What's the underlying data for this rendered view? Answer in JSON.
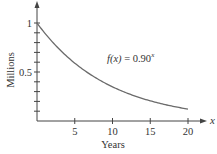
{
  "chart_data": {
    "type": "line",
    "title": "",
    "xlabel": "Years",
    "ylabel": "Millions",
    "xlim": [
      0,
      20
    ],
    "ylim": [
      0,
      1
    ],
    "x_ticks": [
      5,
      10,
      15,
      20
    ],
    "x_tick_labels": [
      "5",
      "10",
      "15",
      "20"
    ],
    "y_ticks": [
      0.5,
      1
    ],
    "y_tick_labels": [
      "0.5",
      "1"
    ],
    "y_minor_tick_step": 0.1,
    "x_axis_var": "x",
    "grid": false,
    "legend": null,
    "annotation": {
      "text_fn": "f(x)",
      "text_eq": " = 0.90",
      "text_exp": "x"
    },
    "series": [
      {
        "name": "f(x) = 0.90^x",
        "formula": "0.90^x",
        "x": [
          0,
          1,
          2,
          3,
          4,
          5,
          6,
          7,
          8,
          9,
          10,
          11,
          12,
          13,
          14,
          15,
          16,
          17,
          18,
          19,
          20
        ],
        "values": [
          1.0,
          0.9,
          0.81,
          0.729,
          0.656,
          0.59,
          0.531,
          0.478,
          0.43,
          0.387,
          0.349,
          0.314,
          0.282,
          0.254,
          0.229,
          0.206,
          0.185,
          0.167,
          0.15,
          0.135,
          0.122
        ],
        "color": "#6b6b6b"
      }
    ],
    "colors": {
      "axis": "#444444",
      "curve": "#6b6b6b",
      "text": "#333333"
    }
  }
}
